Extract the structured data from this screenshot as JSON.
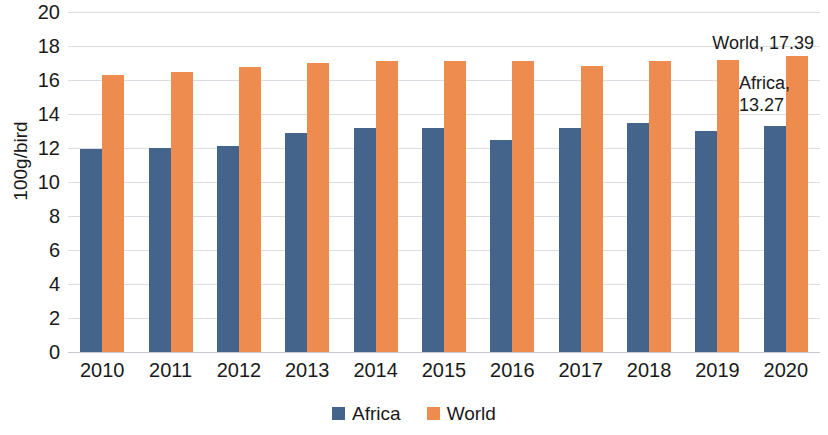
{
  "chart_data": {
    "type": "bar",
    "title": "",
    "subtitle": "",
    "xlabel": "",
    "ylabel": "100g/bird",
    "ylim": [
      0,
      20
    ],
    "ytick_step": 2,
    "yticks": [
      20,
      18,
      16,
      14,
      12,
      10,
      8,
      6,
      4,
      2,
      0
    ],
    "grid": true,
    "legend_position": "bottom-center",
    "categories": [
      "2010",
      "2011",
      "2012",
      "2013",
      "2014",
      "2015",
      "2016",
      "2017",
      "2018",
      "2019",
      "2020"
    ],
    "series": [
      {
        "name": "Africa",
        "color": "#44648C",
        "values": [
          11.95,
          12.0,
          12.1,
          12.9,
          13.15,
          13.2,
          12.5,
          13.2,
          13.45,
          13.0,
          13.27
        ]
      },
      {
        "name": "World",
        "color": "#ED8C4E",
        "values": [
          16.3,
          16.5,
          16.75,
          17.0,
          17.1,
          17.1,
          17.1,
          16.85,
          17.1,
          17.2,
          17.39
        ]
      }
    ],
    "annotations": [
      {
        "id": "world-value",
        "text": "World, 17.39"
      },
      {
        "id": "africa-value",
        "text": "Africa,\n13.27"
      }
    ]
  },
  "legend": {
    "items": [
      {
        "label": "Africa",
        "color": "#44648C"
      },
      {
        "label": "World",
        "color": "#ED8C4E"
      }
    ]
  }
}
